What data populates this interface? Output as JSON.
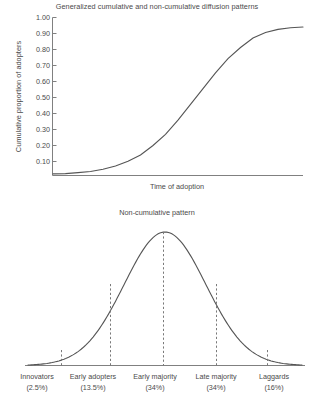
{
  "figure": {
    "title": "Generalized cumulative and non-cumulative diffusion patterns",
    "subtitle": "Non-cumulative pattern"
  },
  "cumulative": {
    "ylabel": "Cumulative proportion of adopters",
    "xlabel": "Time of adoption",
    "ticks": [
      "1.00",
      "0.90",
      "0.80",
      "0.70",
      "0.60",
      "0.50",
      "0.40",
      "0.30",
      "0.20",
      "0.10"
    ]
  },
  "segments": [
    {
      "name": "Innovators",
      "pct": "(2.5%)"
    },
    {
      "name": "Early adopters",
      "pct": "(13.5%)"
    },
    {
      "name": "Early majority",
      "pct": "(34%)"
    },
    {
      "name": "Late majority",
      "pct": "(34%)"
    },
    {
      "name": "Laggards",
      "pct": "(16%)"
    }
  ],
  "colors": {
    "curve": "#555555",
    "axis": "#808080",
    "dash": "#7a7a7a",
    "text": "#4a4a4a"
  },
  "chart_data": [
    {
      "type": "line",
      "title": "Generalized cumulative and non-cumulative diffusion patterns",
      "subtitle": "Cumulative pattern (S-curve)",
      "xlabel": "Time of adoption",
      "ylabel": "Cumulative proportion of adopters",
      "ylim": [
        0.0,
        1.0
      ],
      "yticks": [
        0.1,
        0.2,
        0.3,
        0.4,
        0.5,
        0.6,
        0.7,
        0.8,
        0.9,
        1.0
      ],
      "ytick_labels": [
        "0.10",
        "0.20",
        "0.30",
        "0.40",
        "0.50",
        "0.60",
        "0.70",
        "0.80",
        "0.90",
        "1.00"
      ],
      "xticks": [],
      "xtick_labels": [],
      "grid": false,
      "legend": false,
      "series": [
        {
          "name": "Cumulative proportion of adopters",
          "x": [
            0.0,
            0.05,
            0.1,
            0.15,
            0.2,
            0.25,
            0.3,
            0.35,
            0.4,
            0.45,
            0.5,
            0.55,
            0.6,
            0.65,
            0.7,
            0.75,
            0.8,
            0.85,
            0.9,
            0.95,
            1.0
          ],
          "values": [
            0.01,
            0.012,
            0.018,
            0.025,
            0.04,
            0.06,
            0.09,
            0.13,
            0.19,
            0.26,
            0.35,
            0.45,
            0.55,
            0.65,
            0.74,
            0.81,
            0.87,
            0.905,
            0.925,
            0.935,
            0.94
          ]
        }
      ]
    },
    {
      "type": "line",
      "title": "Non-cumulative pattern",
      "subtitle": "Normal distribution of adopter categories",
      "xlabel": "",
      "ylabel": "",
      "ylim": [
        0,
        1
      ],
      "xticks": [],
      "xtick_labels": [
        "Innovators",
        "Early adopters",
        "Early majority",
        "Late majority",
        "Laggards"
      ],
      "grid": false,
      "legend": false,
      "annotations": [
        {
          "label": "Innovators",
          "percent": 2.5,
          "text": "(2.5%)"
        },
        {
          "label": "Early adopters",
          "percent": 13.5,
          "text": "(13.5%)"
        },
        {
          "label": "Early majority",
          "percent": 34,
          "text": "(34%)"
        },
        {
          "label": "Late majority",
          "percent": 34,
          "text": "(34%)"
        },
        {
          "label": "Laggards",
          "percent": 16,
          "text": "(16%)"
        }
      ],
      "dividers": [
        {
          "at_sd": -2.0,
          "x": 61
        },
        {
          "at_sd": -1.0,
          "x": 110
        },
        {
          "at_sd": 0.0,
          "x": 163
        },
        {
          "at_sd": 1.0,
          "x": 216
        },
        {
          "at_sd": 2.0,
          "x": 267
        }
      ],
      "series": [
        {
          "name": "Non-cumulative adoption rate",
          "x": [
            -3.2,
            -2.8,
            -2.4,
            -2.0,
            -1.6,
            -1.2,
            -0.8,
            -0.4,
            0.0,
            0.4,
            0.8,
            1.2,
            1.6,
            2.0,
            2.4,
            2.8,
            3.2
          ],
          "values": [
            0.01,
            0.03,
            0.07,
            0.14,
            0.28,
            0.47,
            0.7,
            0.92,
            1.0,
            0.92,
            0.7,
            0.47,
            0.28,
            0.14,
            0.07,
            0.03,
            0.01
          ]
        }
      ]
    }
  ]
}
